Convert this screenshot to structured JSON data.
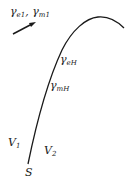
{
  "diagram": {
    "labels": {
      "gamma_e1_m1": {
        "gamma1": "γ",
        "sub1": "e1",
        "sep": ", ",
        "gamma2": "γ",
        "sub2": "m1"
      },
      "gamma_eH": {
        "gamma": "γ",
        "sub": "eH"
      },
      "gamma_mH": {
        "gamma": "γ",
        "sub": "mH"
      },
      "V1": {
        "main": "V",
        "sub": "1"
      },
      "V2": {
        "main": "V",
        "sub": "2"
      },
      "S": "S"
    },
    "colors": {
      "stroke": "#1a1a1a",
      "background": "#ffffff"
    }
  }
}
